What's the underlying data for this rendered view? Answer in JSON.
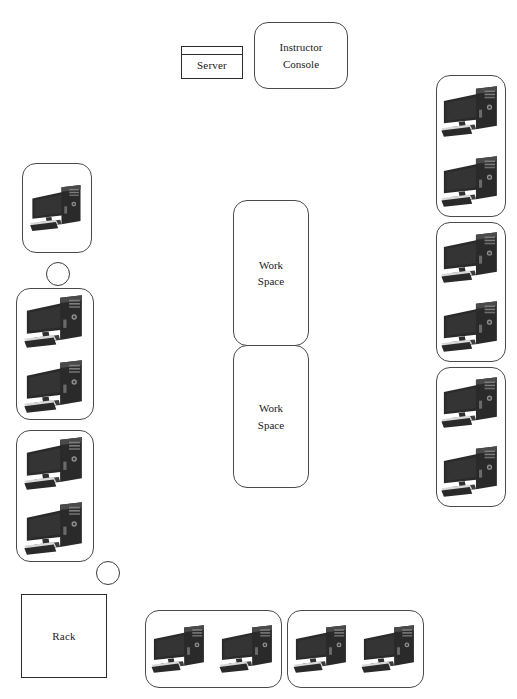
{
  "diagram": {
    "background_color": "#ffffff",
    "outline_color": "#3a3a3a",
    "icon_color": "#2a2a2a"
  },
  "nodes": {
    "server": {
      "label": "Server",
      "shape": "rectangle",
      "x": 181,
      "y": 46,
      "width": 62,
      "height": 33
    },
    "instructor_console": {
      "label": "Instructor\nConsole",
      "line1": "Instructor",
      "line2": "Console",
      "shape": "rounded-rectangle",
      "x": 254,
      "y": 22,
      "width": 94,
      "height": 67
    },
    "rack": {
      "label": "Rack",
      "shape": "rectangle",
      "x": 21,
      "y": 594,
      "width": 86,
      "height": 84
    },
    "workspace_top": {
      "label": "Work\nSpace",
      "line1": "Work",
      "line2": "Space",
      "shape": "rounded-rectangle",
      "x": 233,
      "y": 200,
      "width": 76,
      "height": 146
    },
    "workspace_bottom": {
      "label": "Work\nSpace",
      "line1": "Work",
      "line2": "Space",
      "shape": "rounded-rectangle",
      "x": 233,
      "y": 345,
      "width": 76,
      "height": 143
    }
  },
  "pods": [
    {
      "id": "left-pod-1",
      "side": "left",
      "orientation": "vertical",
      "computers": 1,
      "x": 22,
      "y": 163,
      "width": 70,
      "height": 90
    },
    {
      "id": "left-pod-2",
      "side": "left",
      "orientation": "vertical",
      "computers": 2,
      "x": 16,
      "y": 288,
      "width": 78,
      "height": 132
    },
    {
      "id": "left-pod-3",
      "side": "left",
      "orientation": "vertical",
      "computers": 2,
      "x": 16,
      "y": 430,
      "width": 78,
      "height": 132
    },
    {
      "id": "right-pod-1",
      "side": "right",
      "orientation": "vertical",
      "computers": 2,
      "x": 436,
      "y": 75,
      "width": 70,
      "height": 142
    },
    {
      "id": "right-pod-2",
      "side": "right",
      "orientation": "vertical",
      "computers": 2,
      "x": 436,
      "y": 222,
      "width": 70,
      "height": 140
    },
    {
      "id": "right-pod-3",
      "side": "right",
      "orientation": "vertical",
      "computers": 2,
      "x": 436,
      "y": 367,
      "width": 70,
      "height": 140
    },
    {
      "id": "bottom-pod-1",
      "side": "bottom",
      "orientation": "horizontal",
      "computers": 2,
      "x": 145,
      "y": 610,
      "width": 137,
      "height": 78
    },
    {
      "id": "bottom-pod-2",
      "side": "bottom",
      "orientation": "horizontal",
      "computers": 2,
      "x": 287,
      "y": 610,
      "width": 137,
      "height": 78
    }
  ],
  "circles": [
    {
      "id": "circle-upper-left",
      "x": 46,
      "y": 262,
      "diameter": 24
    },
    {
      "id": "circle-lower-left",
      "x": 96,
      "y": 561,
      "diameter": 24
    }
  ],
  "icons": {
    "computer": "computer-workstation-icon",
    "server": "server-box-icon",
    "rack": "rack-box-icon",
    "stool": "stool-circle-icon"
  },
  "counts": {
    "total_computers": 13,
    "left_computers": 5,
    "right_computers": 6,
    "bottom_computers": 4
  }
}
